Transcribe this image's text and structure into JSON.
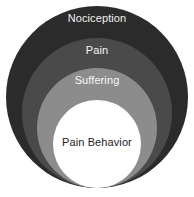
{
  "diagram": {
    "type": "nested-circles",
    "background_color": "#ffffff",
    "layers": [
      {
        "id": "nociception",
        "label": "Nociception",
        "level": 1,
        "fill_color": "#2b2b2b",
        "text_color": "#f2f2f2",
        "diameter_px": 182
      },
      {
        "id": "pain",
        "label": "Pain",
        "level": 2,
        "fill_color": "#4a4a4a",
        "text_color": "#f4f4f4",
        "diameter_px": 150
      },
      {
        "id": "suffering",
        "label": "Suffering",
        "level": 3,
        "fill_color": "#8c8c8c",
        "text_color": "#f7f7f7",
        "diameter_px": 120
      },
      {
        "id": "pain-behavior",
        "label": "Pain Behavior",
        "level": 4,
        "fill_color": "#ffffff",
        "text_color": "#1c1c1c",
        "diameter_px": 88
      }
    ]
  }
}
